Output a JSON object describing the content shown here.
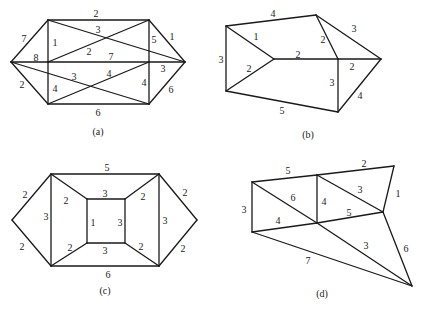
{
  "graphs": [
    {
      "id": "a",
      "caption": "(a)",
      "caption_pos": [
        98,
        131
      ],
      "vertices": {
        "L": [
          11,
          62
        ],
        "TL": [
          48,
          20
        ],
        "ML": [
          48,
          62
        ],
        "BL": [
          48,
          104
        ],
        "TR": [
          149,
          20
        ],
        "MR": [
          149,
          62
        ],
        "BR": [
          149,
          104
        ],
        "R": [
          185,
          62
        ]
      },
      "edges": [
        {
          "from": "TL",
          "to": "TR",
          "weight": "2",
          "lp": [
            96,
            13
          ]
        },
        {
          "from": "L",
          "to": "TL",
          "weight": "7",
          "lp": [
            24,
            38
          ]
        },
        {
          "from": "TL",
          "to": "ML",
          "weight": "1",
          "lp": [
            55,
            42
          ]
        },
        {
          "from": "L",
          "to": "ML",
          "weight": "8",
          "lp": [
            36,
            57
          ]
        },
        {
          "from": "ML",
          "to": "MR",
          "weight": "7",
          "lp": [
            111,
            56
          ]
        },
        {
          "from": "MR",
          "to": "R",
          "weight": "3",
          "lp": [
            163,
            68
          ]
        },
        {
          "from": "TL",
          "to": "R",
          "weight": "3",
          "lp": [
            98,
            29
          ]
        },
        {
          "from": "ML",
          "to": "TR",
          "weight": "2",
          "lp": [
            89,
            51
          ]
        },
        {
          "from": "TR",
          "to": "MR",
          "weight": "5",
          "lp": [
            154,
            39
          ]
        },
        {
          "from": "TR",
          "to": "R",
          "weight": "1",
          "lp": [
            172,
            36
          ]
        },
        {
          "from": "L",
          "to": "BL",
          "weight": "2",
          "lp": [
            22,
            84
          ]
        },
        {
          "from": "ML",
          "to": "BL",
          "weight": "4",
          "lp": [
            55,
            88
          ]
        },
        {
          "from": "L",
          "to": "BR",
          "weight": "3",
          "lp": [
            74,
            76
          ]
        },
        {
          "from": "BL",
          "to": "MR",
          "weight": "4",
          "lp": [
            109,
            73
          ]
        },
        {
          "from": "MR",
          "to": "BR",
          "weight": "4",
          "lp": [
            144,
            82
          ]
        },
        {
          "from": "BR",
          "to": "R",
          "weight": "6",
          "lp": [
            171,
            89
          ]
        },
        {
          "from": "BL",
          "to": "BR",
          "weight": "6",
          "lp": [
            98,
            112
          ]
        }
      ]
    },
    {
      "id": "b",
      "caption": "(b)",
      "caption_pos": [
        308,
        134
      ],
      "vertices": {
        "TL": [
          226,
          26
        ],
        "BL": [
          226,
          91
        ],
        "C": [
          274,
          59
        ],
        "T": [
          316,
          15
        ],
        "M": [
          338,
          59
        ],
        "R": [
          381,
          59
        ],
        "B": [
          338,
          112
        ]
      },
      "edges": [
        {
          "from": "TL",
          "to": "T",
          "weight": "4",
          "lp": [
            273,
            13
          ]
        },
        {
          "from": "TL",
          "to": "BL",
          "weight": "3",
          "lp": [
            221,
            59
          ]
        },
        {
          "from": "TL",
          "to": "C",
          "weight": "1",
          "lp": [
            256,
            36
          ]
        },
        {
          "from": "BL",
          "to": "C",
          "weight": "2",
          "lp": [
            249,
            68
          ]
        },
        {
          "from": "C",
          "to": "M",
          "weight": "2",
          "lp": [
            298,
            54
          ]
        },
        {
          "from": "T",
          "to": "M",
          "weight": "2",
          "lp": [
            323,
            39
          ]
        },
        {
          "from": "T",
          "to": "R",
          "weight": "3",
          "lp": [
            354,
            28
          ]
        },
        {
          "from": "M",
          "to": "R",
          "weight": "2",
          "lp": [
            352,
            66
          ]
        },
        {
          "from": "M",
          "to": "B",
          "weight": "3",
          "lp": [
            332,
            82
          ]
        },
        {
          "from": "R",
          "to": "B",
          "weight": "4",
          "lp": [
            360,
            95
          ]
        },
        {
          "from": "BL",
          "to": "B",
          "weight": "5",
          "lp": [
            282,
            110
          ]
        }
      ]
    },
    {
      "id": "c",
      "caption": "(c)",
      "caption_pos": [
        105,
        290
      ],
      "vertices": {
        "L": [
          12,
          220
        ],
        "TL": [
          51,
          174
        ],
        "BL": [
          51,
          266
        ],
        "ITL": [
          87,
          199
        ],
        "ITR": [
          125,
          199
        ],
        "IBL": [
          87,
          243
        ],
        "IBR": [
          125,
          243
        ],
        "TR": [
          159,
          174
        ],
        "BR": [
          159,
          266
        ],
        "R": [
          197,
          220
        ]
      },
      "edges": [
        {
          "from": "TL",
          "to": "TR",
          "weight": "5",
          "lp": [
            107,
            167
          ]
        },
        {
          "from": "L",
          "to": "TL",
          "weight": "2",
          "lp": [
            25,
            194
          ]
        },
        {
          "from": "L",
          "to": "BL",
          "weight": "2",
          "lp": [
            22,
            246
          ]
        },
        {
          "from": "TL",
          "to": "BL",
          "weight": "3",
          "lp": [
            46,
            216
          ]
        },
        {
          "from": "TL",
          "to": "ITL",
          "weight": "2",
          "lp": [
            66,
            200
          ]
        },
        {
          "from": "BL",
          "to": "IBL",
          "weight": "2",
          "lp": [
            70,
            247
          ]
        },
        {
          "from": "ITL",
          "to": "ITR",
          "weight": "3",
          "lp": [
            105,
            193
          ]
        },
        {
          "from": "IBL",
          "to": "IBR",
          "weight": "3",
          "lp": [
            105,
            250
          ]
        },
        {
          "from": "ITL",
          "to": "IBL",
          "weight": "1",
          "lp": [
            93,
            222
          ]
        },
        {
          "from": "ITR",
          "to": "IBR",
          "weight": "3",
          "lp": [
            120,
            222
          ]
        },
        {
          "from": "ITR",
          "to": "TR",
          "weight": "2",
          "lp": [
            143,
            196
          ]
        },
        {
          "from": "IBR",
          "to": "BR",
          "weight": "2",
          "lp": [
            141,
            246
          ]
        },
        {
          "from": "TR",
          "to": "BR",
          "weight": "3",
          "lp": [
            165,
            220
          ]
        },
        {
          "from": "TR",
          "to": "R",
          "weight": "2",
          "lp": [
            185,
            192
          ]
        },
        {
          "from": "BR",
          "to": "R",
          "weight": "2",
          "lp": [
            183,
            248
          ]
        },
        {
          "from": "BL",
          "to": "BR",
          "weight": "6",
          "lp": [
            108,
            274
          ]
        }
      ]
    },
    {
      "id": "d",
      "caption": "(d)",
      "caption_pos": [
        322,
        293
      ],
      "vertices": {
        "TL": [
          252,
          182
        ],
        "BL": [
          252,
          232
        ],
        "TM": [
          317,
          175
        ],
        "C": [
          317,
          223
        ],
        "TR": [
          394,
          166
        ],
        "MR": [
          383,
          212
        ],
        "B": [
          412,
          286
        ]
      },
      "edges": [
        {
          "from": "TL",
          "to": "TM",
          "weight": "5",
          "lp": [
            288,
            170
          ]
        },
        {
          "from": "TM",
          "to": "TR",
          "weight": "2",
          "lp": [
            364,
            163
          ]
        },
        {
          "from": "TL",
          "to": "BL",
          "weight": "3",
          "lp": [
            244,
            209
          ]
        },
        {
          "from": "TL",
          "to": "C",
          "weight": "6",
          "lp": [
            293,
            197
          ]
        },
        {
          "from": "TM",
          "to": "C",
          "weight": "4",
          "lp": [
            324,
            201
          ]
        },
        {
          "from": "TM",
          "to": "MR",
          "weight": "3",
          "lp": [
            360,
            189
          ]
        },
        {
          "from": "TR",
          "to": "MR",
          "weight": "1",
          "lp": [
            398,
            193
          ]
        },
        {
          "from": "BL",
          "to": "C",
          "weight": "4",
          "lp": [
            278,
            220
          ]
        },
        {
          "from": "C",
          "to": "MR",
          "weight": "5",
          "lp": [
            349,
            212
          ]
        },
        {
          "from": "C",
          "to": "B",
          "weight": "3",
          "lp": [
            366,
            245
          ]
        },
        {
          "from": "MR",
          "to": "B",
          "weight": "6",
          "lp": [
            406,
            248
          ]
        },
        {
          "from": "BL",
          "to": "B",
          "weight": "7",
          "lp": [
            308,
            260
          ]
        }
      ]
    }
  ]
}
